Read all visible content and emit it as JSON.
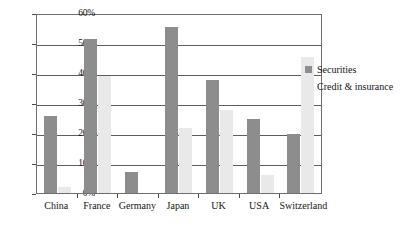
{
  "chart_data": {
    "type": "bar",
    "title": "",
    "subtitle": "",
    "xlabel": "",
    "ylabel": "",
    "ylim": [
      0,
      60
    ],
    "y_unit": "%",
    "grid": true,
    "legend_position": "right",
    "categories": [
      "China",
      "France",
      "Germany",
      "Japan",
      "UK",
      "USA",
      "Switzerland"
    ],
    "y_ticks": [
      "0%",
      "10%",
      "20%",
      "30%",
      "40%",
      "50%",
      "60%"
    ],
    "y_tick_values": [
      0,
      10,
      20,
      30,
      40,
      50,
      60
    ],
    "series": [
      {
        "name": "Securities",
        "color": "#8d8d8d",
        "values": [
          26,
          52,
          7,
          56,
          38,
          25,
          20
        ]
      },
      {
        "name": "Credit & insurance",
        "color": "#e9e9e9",
        "values": [
          2,
          39.5,
          0,
          22,
          28,
          6,
          46
        ]
      }
    ]
  },
  "legend": {
    "items": [
      {
        "label": "Securities",
        "swatch": "securities-swatch"
      },
      {
        "label": "Credit & insurance",
        "swatch": "credit-insurance-swatch"
      }
    ]
  }
}
